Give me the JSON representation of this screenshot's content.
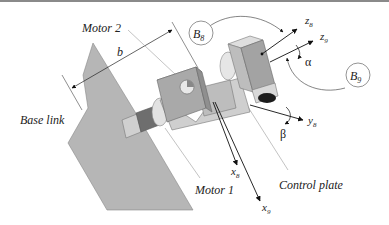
{
  "diagram": {
    "title": "",
    "labels": {
      "motor2": "Motor 2",
      "motor1": "Motor 1",
      "base_link": "Base link",
      "control_plate": "Control plate",
      "dimension_b": "b",
      "frame_b8": "B",
      "frame_b8_sub": "8",
      "frame_b9": "B",
      "frame_b9_sub": "9",
      "z8": "z",
      "z8_sub": "8",
      "z9": "z",
      "z9_sub": "9",
      "y8": "y",
      "y8_sub": "8",
      "x8": "x",
      "x8_sub": "8",
      "x9": "x",
      "x9_sub": "9",
      "alpha": "α",
      "beta": "β"
    },
    "colors": {
      "base_plate": "#b4b4b4",
      "motor_body": "#c8c8c8",
      "motor_face": "#a9a9a9",
      "shaft_dark": "#6e6e6e",
      "line": "#222222",
      "leader": "#9a9a9a"
    }
  }
}
